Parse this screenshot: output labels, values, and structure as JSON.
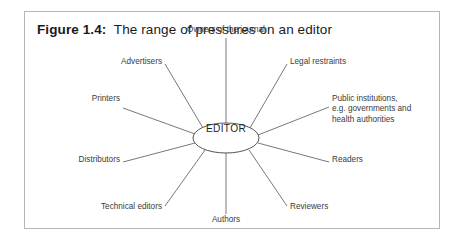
{
  "figure": {
    "number_label": "Figure 1.4:",
    "caption": "The range of pressures on an editor",
    "border_color": "#b5b5b5",
    "background_color": "#ffffff",
    "line_color": "#555555",
    "text_color": "#3b3b3b"
  },
  "diagram": {
    "type": "radial-spoke",
    "center": {
      "label": "EDITOR",
      "shape": "ellipse",
      "cx": 201,
      "cy": 126,
      "rx": 33,
      "ry": 15
    },
    "nodes": [
      {
        "id": "owners",
        "label": "Owners of the journal",
        "lines": [
          "Owners of the journal"
        ],
        "angle_deg": 270,
        "label_x": 201,
        "label_y": 13,
        "align": "center"
      },
      {
        "id": "legal",
        "label": "Legal restraints",
        "lines": [
          "Legal restraints"
        ],
        "angle_deg": 315,
        "label_x": 265,
        "label_y": 45,
        "align": "left"
      },
      {
        "id": "public",
        "label": "Public institutions, e.g. governments and health authorities",
        "lines": [
          "Public institutions,",
          "e.g. governments and",
          "health authorities"
        ],
        "angle_deg": 342,
        "label_x": 307,
        "label_y": 82,
        "align": "left"
      },
      {
        "id": "readers",
        "label": "Readers",
        "lines": [
          "Readers"
        ],
        "angle_deg": 20,
        "label_x": 307,
        "label_y": 143,
        "align": "left"
      },
      {
        "id": "reviewers",
        "label": "Reviewers",
        "lines": [
          "Reviewers"
        ],
        "angle_deg": 48,
        "label_x": 265,
        "label_y": 190,
        "align": "left"
      },
      {
        "id": "authors",
        "label": "Authors",
        "lines": [
          "Authors"
        ],
        "angle_deg": 90,
        "label_x": 201,
        "label_y": 203,
        "align": "center"
      },
      {
        "id": "technical",
        "label": "Technical editors",
        "lines": [
          "Technical editors"
        ],
        "angle_deg": 132,
        "label_x": 137,
        "label_y": 190,
        "align": "right"
      },
      {
        "id": "distrib",
        "label": "Distributors",
        "lines": [
          "Distributors"
        ],
        "angle_deg": 160,
        "label_x": 95,
        "label_y": 143,
        "align": "right"
      },
      {
        "id": "printers",
        "label": "Printers",
        "lines": [
          "Printers"
        ],
        "angle_deg": 198,
        "label_x": 95,
        "label_y": 82,
        "align": "right"
      },
      {
        "id": "advert",
        "label": "Advertisers",
        "lines": [
          "Advertisers"
        ],
        "angle_deg": 225,
        "label_x": 137,
        "label_y": 45,
        "align": "right"
      }
    ],
    "spokes": [
      {
        "id": "spoke-owners",
        "x1": 201,
        "y1": 111,
        "x2": 201,
        "y2": 26
      },
      {
        "id": "spoke-legal",
        "x1": 225,
        "y1": 116,
        "x2": 262,
        "y2": 52
      },
      {
        "id": "spoke-public",
        "x1": 233,
        "y1": 123,
        "x2": 304,
        "y2": 95
      },
      {
        "id": "spoke-readers",
        "x1": 233,
        "y1": 131,
        "x2": 304,
        "y2": 150
      },
      {
        "id": "spoke-reviewers",
        "x1": 224,
        "y1": 138,
        "x2": 262,
        "y2": 194
      },
      {
        "id": "spoke-authors",
        "x1": 201,
        "y1": 141,
        "x2": 201,
        "y2": 202
      },
      {
        "id": "spoke-technical",
        "x1": 180,
        "y1": 138,
        "x2": 140,
        "y2": 194
      },
      {
        "id": "spoke-distrib",
        "x1": 170,
        "y1": 131,
        "x2": 98,
        "y2": 150
      },
      {
        "id": "spoke-printers",
        "x1": 170,
        "y1": 122,
        "x2": 98,
        "y2": 96
      },
      {
        "id": "spoke-advert",
        "x1": 178,
        "y1": 116,
        "x2": 140,
        "y2": 52
      }
    ]
  }
}
